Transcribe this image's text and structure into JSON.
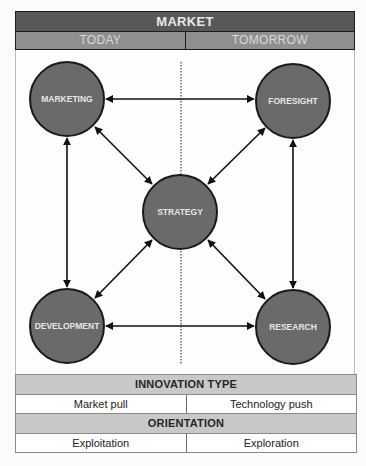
{
  "header": {
    "title": "MARKET",
    "columns": [
      "TODAY",
      "TOMORROW"
    ]
  },
  "diagram": {
    "nodes": [
      {
        "id": "marketing",
        "label": "MARKETING",
        "cx": 67,
        "cy": 99
      },
      {
        "id": "foresight",
        "label": "FORESIGHT",
        "cx": 293,
        "cy": 101
      },
      {
        "id": "strategy",
        "label": "STRATEGY",
        "cx": 180,
        "cy": 212
      },
      {
        "id": "development",
        "label": "DEVELOPMENT",
        "cx": 67,
        "cy": 326
      },
      {
        "id": "research",
        "label": "RESEARCH",
        "cx": 293,
        "cy": 327
      }
    ],
    "node_radius": 37,
    "node_fill": "#6a6a6a",
    "node_stroke": "#1a1a1a",
    "edges": [
      [
        "marketing",
        "foresight"
      ],
      [
        "marketing",
        "development"
      ],
      [
        "foresight",
        "research"
      ],
      [
        "development",
        "research"
      ],
      [
        "marketing",
        "strategy"
      ],
      [
        "foresight",
        "strategy"
      ],
      [
        "development",
        "strategy"
      ],
      [
        "research",
        "strategy"
      ]
    ],
    "edge_style": "double-headed arrow",
    "divider": "dotted vertical line"
  },
  "footer": {
    "innovation_type": {
      "title": "INNOVATION TYPE",
      "values": [
        "Market pull",
        "Technology push"
      ]
    },
    "orientation": {
      "title": "ORIENTATION",
      "values": [
        "Exploitation",
        "Exploration"
      ]
    }
  },
  "colors": {
    "header_dark": "#585858",
    "header_mid": "#8f8f8f",
    "section_header": "#c8c8c8",
    "node_fill": "#6a6a6a"
  }
}
